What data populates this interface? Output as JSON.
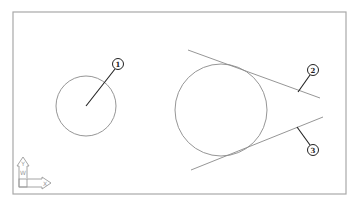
{
  "drawing": {
    "frame": {
      "x": 13,
      "y": 12,
      "width": 333,
      "height": 182
    },
    "circles": [
      {
        "id": "small-circle",
        "cx": 86,
        "cy": 106,
        "r": 30
      },
      {
        "id": "large-circle",
        "cx": 221,
        "cy": 110,
        "r": 46
      }
    ],
    "tangent_lines": [
      {
        "id": "upper-tangent",
        "x1": 188,
        "y1": 50,
        "x2": 320,
        "y2": 98
      },
      {
        "id": "lower-tangent",
        "x1": 191,
        "y1": 170,
        "x2": 323,
        "y2": 117
      }
    ],
    "callouts": [
      {
        "label": "1",
        "cx": 118,
        "cy": 64,
        "r": 5.5,
        "leader": {
          "x1": 115,
          "y1": 69,
          "x2": 86,
          "y2": 106
        }
      },
      {
        "label": "2",
        "cx": 313,
        "cy": 70,
        "r": 5.5,
        "leader": {
          "x1": 310,
          "y1": 75,
          "x2": 298,
          "y2": 92
        }
      },
      {
        "label": "3",
        "cx": 313,
        "cy": 150,
        "r": 5.5,
        "leader": {
          "x1": 310,
          "y1": 145,
          "x2": 297,
          "y2": 127
        }
      }
    ],
    "ucs_icon": {
      "y_label": "Y",
      "x_label": "X",
      "w_label": "W"
    }
  },
  "colors": {
    "frame": "#a8a8a8",
    "geometry": "#8a8a8a",
    "callout": "#222222",
    "ucs": "#9a9a9a"
  }
}
